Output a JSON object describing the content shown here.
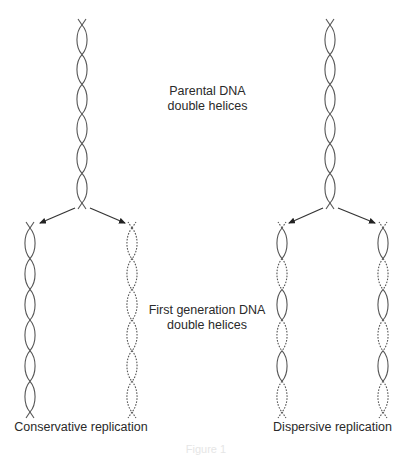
{
  "figure": {
    "stroke_color": "#555555",
    "background": "#ffffff",
    "labels": {
      "parental_line1": "Parental DNA",
      "parental_line2": "double helices",
      "first_gen_line1": "First generation DNA",
      "first_gen_line2": "double helices",
      "conservative": "Conservative replication",
      "dispersive": "Dispersive replication",
      "caption": "Figure 1"
    },
    "helices": [
      {
        "id": "parental-left",
        "x": 82,
        "y0": 25,
        "y1": 203,
        "loops": 6,
        "pattern": [
          "solid",
          "solid",
          "solid",
          "solid",
          "solid",
          "solid"
        ]
      },
      {
        "id": "parental-right",
        "x": 330,
        "y0": 25,
        "y1": 203,
        "loops": 6,
        "pattern": [
          "solid",
          "solid",
          "solid",
          "solid",
          "solid",
          "solid"
        ]
      },
      {
        "id": "conservative-old",
        "x": 30,
        "y0": 228,
        "y1": 412,
        "loops": 6,
        "pattern": [
          "solid",
          "solid",
          "solid",
          "solid",
          "solid",
          "solid"
        ]
      },
      {
        "id": "conservative-new",
        "x": 132,
        "y0": 228,
        "y1": 412,
        "loops": 6,
        "pattern": [
          "dashed",
          "dashed",
          "dashed",
          "dashed",
          "dashed",
          "dashed"
        ]
      },
      {
        "id": "dispersive-1",
        "x": 282,
        "y0": 228,
        "y1": 412,
        "loops": 6,
        "pattern": [
          "solid",
          "dashed",
          "solid",
          "dashed",
          "solid",
          "dashed"
        ]
      },
      {
        "id": "dispersive-2",
        "x": 383,
        "y0": 228,
        "y1": 412,
        "loops": 6,
        "pattern": [
          "solid",
          "dashed",
          "solid",
          "dashed",
          "solid",
          "dashed"
        ]
      }
    ],
    "arrows": [
      {
        "from": [
          75,
          208
        ],
        "to": [
          40,
          223
        ]
      },
      {
        "from": [
          90,
          208
        ],
        "to": [
          125,
          223
        ]
      },
      {
        "from": [
          323,
          208
        ],
        "to": [
          289,
          223
        ]
      },
      {
        "from": [
          338,
          208
        ],
        "to": [
          375,
          223
        ]
      }
    ]
  }
}
